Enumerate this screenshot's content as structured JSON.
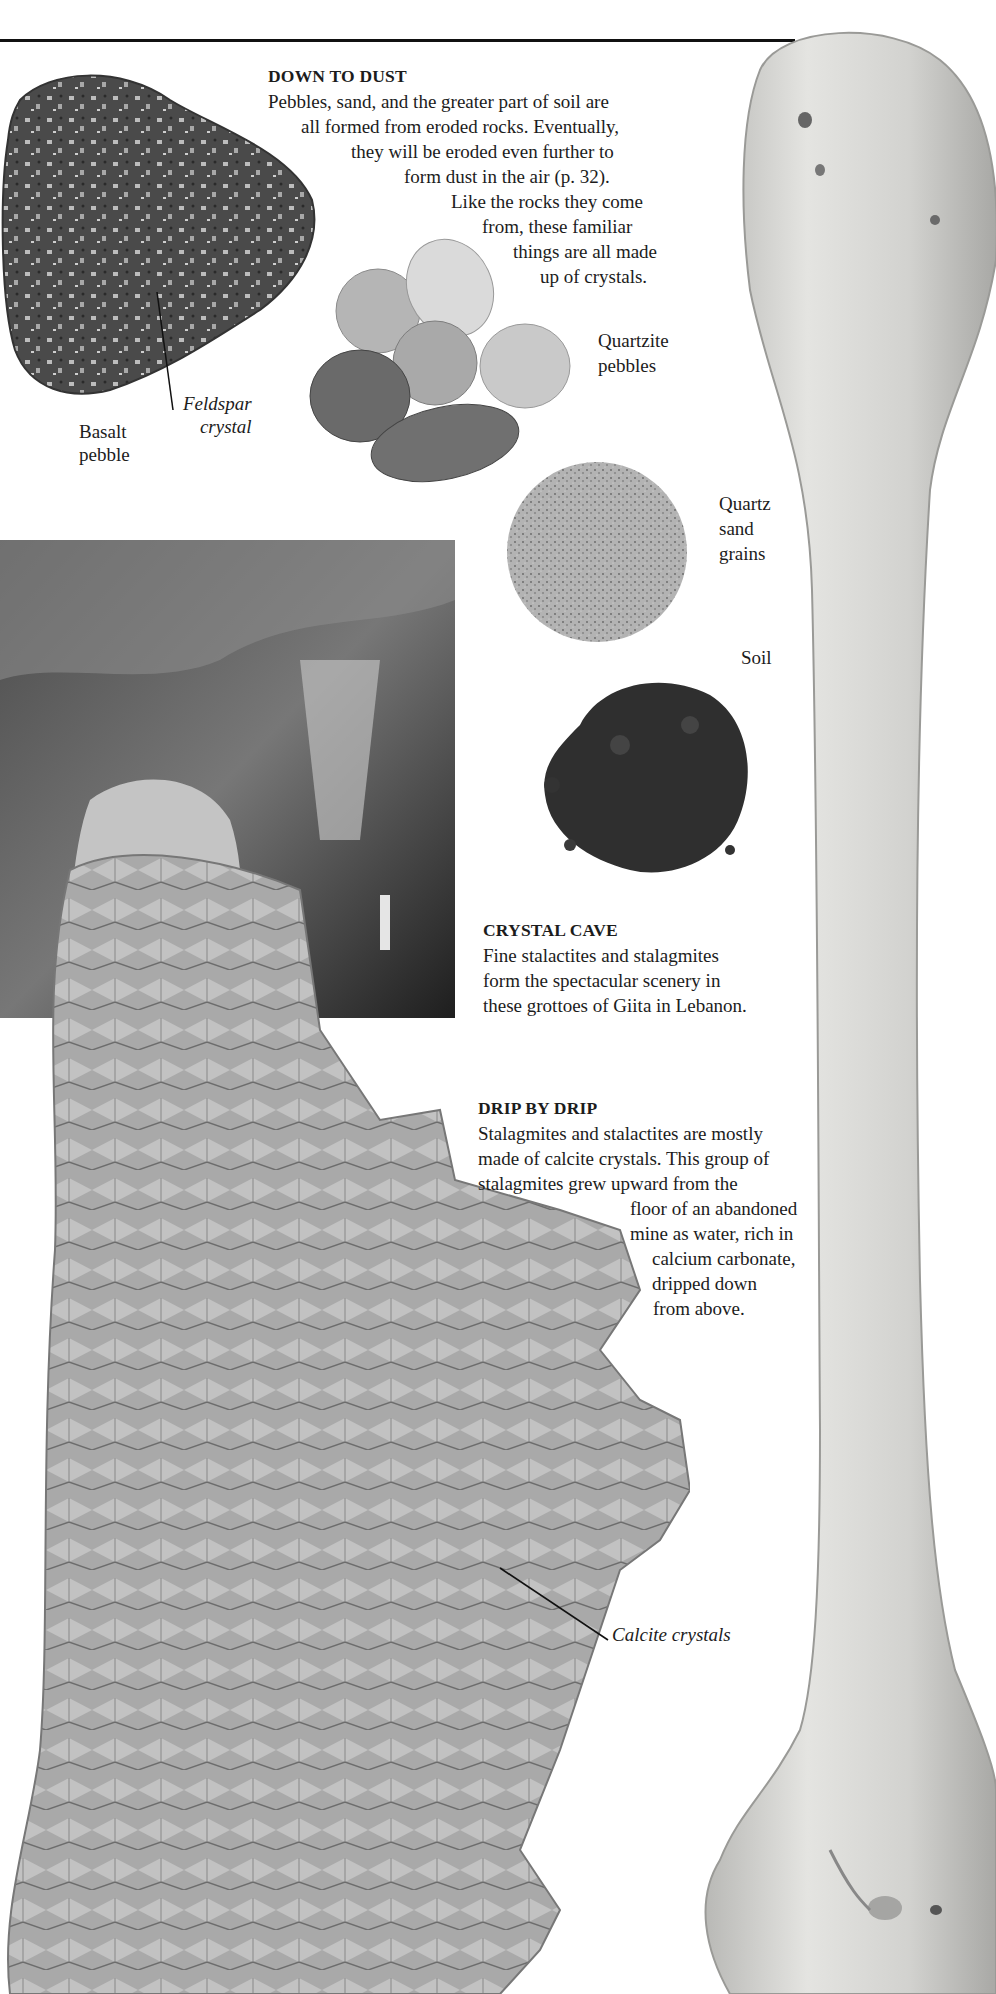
{
  "page": {
    "type": "book-page",
    "theme": "rocks-and-crystals"
  },
  "colors": {
    "text": "#1c1c1c",
    "rule": "#111111",
    "background": "#ffffff",
    "bone": "#d9d9d6",
    "cave_dark": "#2a2a2a",
    "calcite": "#a9a9a9"
  },
  "sections": {
    "down_to_dust": {
      "heading": "DOWN TO DUST",
      "lines": [
        "Pebbles, sand, and the greater part of soil are",
        "all formed from eroded rocks. Eventually,",
        "they will be eroded even further to",
        "form dust in the air (p. 32).",
        "Like the rocks they come",
        "from, these familiar",
        "things are all made",
        "up of crystals."
      ]
    },
    "crystal_cave": {
      "heading": "CRYSTAL CAVE",
      "lines": [
        "Fine stalactites and stalagmites",
        "form the spectacular scenery in",
        "these grottoes of Giita in Lebanon."
      ]
    },
    "drip_by_drip": {
      "heading": "DRIP BY DRIP",
      "lines": [
        "Stalagmites and stalactites are mostly",
        "made of calcite crystals. This group of",
        "stalagmites grew upward from the",
        "floor of an abandoned",
        "mine as water, rich in",
        "calcium carbonate,",
        "dripped down",
        "from above."
      ]
    }
  },
  "labels": {
    "basalt_pebble": [
      "Basalt",
      "pebble"
    ],
    "feldspar_crystal": [
      "Feldspar",
      "crystal"
    ],
    "quartzite_pebbles": [
      "Quartzite",
      "pebbles"
    ],
    "quartz_sand_grains": [
      "Quartz",
      "sand",
      "grains"
    ],
    "soil": "Soil",
    "calcite_crystals": "Calcite crystals"
  },
  "images": {
    "basalt": "basalt-pebble-photo",
    "pebbles": "quartzite-pebbles-photo",
    "sand": "quartz-sand-photo",
    "soil": "soil-photo",
    "cave": "crystal-cave-photo",
    "calcite": "calcite-stalagmites-photo",
    "bone": "bone-photo"
  }
}
